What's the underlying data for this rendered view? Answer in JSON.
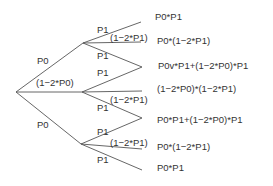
{
  "diagram": {
    "type": "probability-tree",
    "line_color": "#555555",
    "text_color": "#333333",
    "level1": [
      {
        "label": "P0"
      },
      {
        "label": "(1−2*P0)"
      },
      {
        "label": "P0"
      }
    ],
    "level2_labels": {
      "upper_top": "P1",
      "upper_mid": "(1−2*P1)",
      "upper_bot": "P1",
      "middle_top": "P1",
      "middle_mid": "(1−2*P1)",
      "middle_bot": "P1",
      "lower_top": "P1",
      "lower_mid": "(1−2*P1)",
      "lower_bot": "P1"
    },
    "outcomes": [
      "P0*P1",
      "P0*(1−2*P1)",
      "P0v*P1+(1−2*P0)*P1",
      "(1−2*P0)*(1−2*P1)",
      "P0*P1+(1−2*P0)*P1",
      "P0*(1−2*P1)",
      "P0*P1"
    ]
  }
}
